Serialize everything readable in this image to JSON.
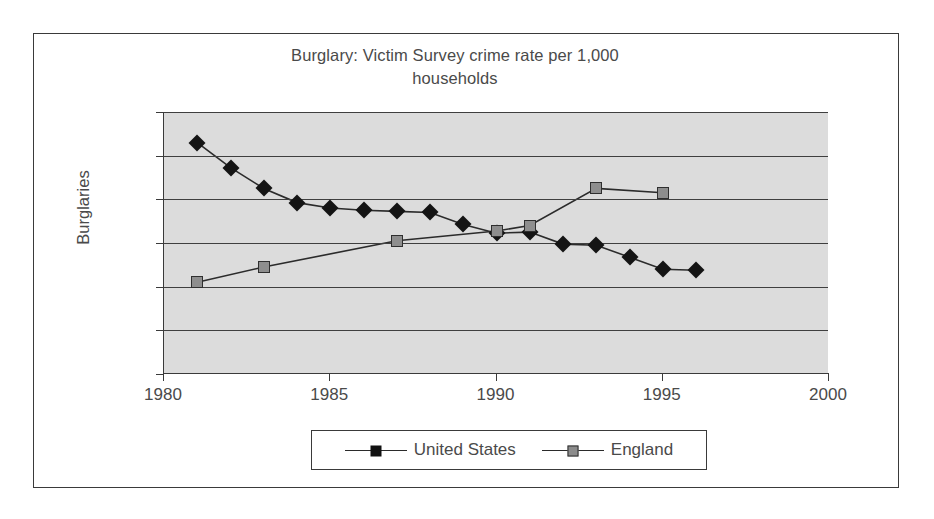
{
  "chart_data": {
    "type": "line",
    "title": "Burglary: Victim Survey crime rate per 1,000 households",
    "title_line1": "Burglary: Victim Survey crime rate per 1,000",
    "title_line2": "households",
    "xlabel": "",
    "ylabel": "Burglaries",
    "xlim": [
      1980,
      2000
    ],
    "ylim": [
      0,
      120
    ],
    "xticks": [
      1980,
      1985,
      1990,
      1995,
      2000
    ],
    "xtick_labels": [
      "1980",
      "1985",
      "1990",
      "1995",
      "2000"
    ],
    "yticks": [
      0,
      20,
      40,
      60,
      80,
      100,
      120
    ],
    "ytick_labels": [
      "0",
      "20",
      "40",
      "60",
      "80",
      "100",
      "120"
    ],
    "grid": true,
    "grid_axis": "y",
    "legend_position": "bottom",
    "plot_background": "#dcdcdc",
    "series": [
      {
        "name": "United States",
        "marker": "diamond",
        "color": "#141414",
        "x": [
          1981,
          1982,
          1983,
          1984,
          1985,
          1986,
          1987,
          1988,
          1989,
          1990,
          1991,
          1992,
          1993,
          1994,
          1995,
          1996
        ],
        "values": [
          106,
          94.5,
          85,
          78.5,
          76,
          75,
          74.5,
          74,
          68.5,
          64.5,
          65,
          59.5,
          59,
          53.5,
          48,
          47.5
        ]
      },
      {
        "name": "England",
        "marker": "square",
        "color": "#8e8e8e",
        "x": [
          1981,
          1983,
          1987,
          1990,
          1991,
          1993,
          1995
        ],
        "values": [
          42,
          49,
          61,
          65.5,
          68,
          85,
          83
        ]
      }
    ]
  },
  "legend": {
    "items": [
      {
        "label": "United States",
        "marker": "diamond-marker"
      },
      {
        "label": "England",
        "marker": "square-marker"
      }
    ]
  }
}
